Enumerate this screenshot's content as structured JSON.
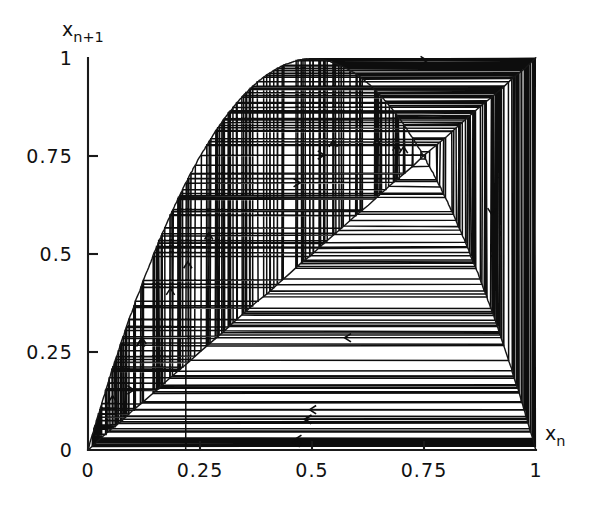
{
  "figure": {
    "background_color": "#ffffff",
    "ink_color": "#111111",
    "width": 596,
    "height": 524
  },
  "chart_data": {
    "type": "line",
    "title": "",
    "subtitle": "",
    "xlabel": "x_n",
    "xlabel_base": "x",
    "xlabel_sub": "n",
    "ylabel": "x_n+1",
    "ylabel_base": "x",
    "ylabel_sub": "n+1",
    "xlim": [
      0,
      1
    ],
    "ylim": [
      0,
      1
    ],
    "xticks": [
      0,
      0.25,
      0.5,
      0.75,
      1
    ],
    "yticks": [
      0,
      0.25,
      0.5,
      0.75,
      1
    ],
    "xticklabels": [
      "0",
      "0.25",
      "0.5",
      "0.75",
      "1"
    ],
    "yticklabels": [
      "0",
      "0.25",
      "0.5",
      "0.75",
      "1"
    ],
    "grid": false,
    "legend": false,
    "legend_position": "none",
    "series": [
      {
        "name": "logistic map curve",
        "kind": "function",
        "equation": "x_n+1 = r * x_n * (1 - x_n)",
        "r": 3.99,
        "samples": 400,
        "peak": {
          "x": 0.5,
          "y": 0.9975
        },
        "endpoints": [
          {
            "x": 0,
            "y": 0
          },
          {
            "x": 1,
            "y": 0
          }
        ]
      },
      {
        "name": "identity line",
        "kind": "line",
        "equation": "x_n+1 = x_n",
        "endpoints": [
          {
            "x": 0,
            "y": 0
          },
          {
            "x": 1,
            "y": 1
          }
        ]
      },
      {
        "name": "cobweb orbit",
        "kind": "cobweb",
        "x0": 0.2187,
        "iterations": 260,
        "arrow_count": 22,
        "description": "staircase/cobweb iteration of the logistic map showing chaotic orbit filling the unit square"
      }
    ]
  },
  "axes": {
    "x_axis_name": "x-axis",
    "y_axis_name": "y-axis",
    "origin_label": "0"
  }
}
